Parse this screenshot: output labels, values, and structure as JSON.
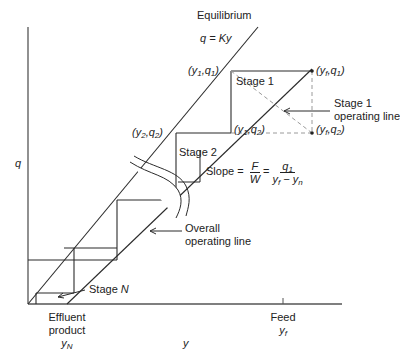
{
  "diagram": {
    "type": "mccabe-thiele-style staged operating diagram",
    "axes": {
      "x_label": "y",
      "y_label": "q",
      "x_ticks": [
        {
          "label_lines": [
            "Effluent",
            "product"
          ],
          "symbol": "y",
          "subscript": "N"
        },
        {
          "label_lines": [
            "Feed"
          ],
          "symbol": "y",
          "subscript": "f"
        }
      ]
    },
    "equilibrium": {
      "title": "Equilibrium",
      "equation": "q = Ky"
    },
    "points": [
      {
        "id": "y1q1",
        "text": "(y",
        "sub1": "1",
        "mid": ",q",
        "sub2": "1",
        "end": ")"
      },
      {
        "id": "yfq1",
        "text": "(y",
        "sub1": "f",
        "mid": ",q",
        "sub2": "1",
        "end": ")"
      },
      {
        "id": "y2q2",
        "text": "(y",
        "sub1": "2",
        "mid": ",q",
        "sub2": "2",
        "end": ")"
      },
      {
        "id": "y1q2",
        "text": "(y",
        "sub1": "1",
        "mid": ",q",
        "sub2": "2",
        "end": ")"
      },
      {
        "id": "yfq2",
        "text": "(y",
        "sub1": "f",
        "mid": ",q",
        "sub2": "2",
        "end": ")"
      }
    ],
    "stages": {
      "stage1": "Stage 1",
      "stage2": "Stage 2",
      "stageN_prefix": "Stage ",
      "stageN_italic": "N"
    },
    "annotations": {
      "stage1_operating_line": [
        "Stage 1",
        "operating line"
      ],
      "overall_operating_line": [
        "Overall",
        "operating line"
      ],
      "slope": {
        "prefix": "Slope =",
        "frac1_num": "F",
        "frac1_den": "W",
        "equals": "=",
        "frac2_num": "q",
        "frac2_num_sub": "1",
        "frac2_den_a": "y",
        "frac2_den_a_sub": "f",
        "frac2_den_minus": " − ",
        "frac2_den_b": "y",
        "frac2_den_b_sub": "n"
      }
    },
    "colors": {
      "line": "#2b2b2b",
      "dashed": "#9a9a9a",
      "axis": "#555555",
      "background": "#ffffff"
    }
  }
}
